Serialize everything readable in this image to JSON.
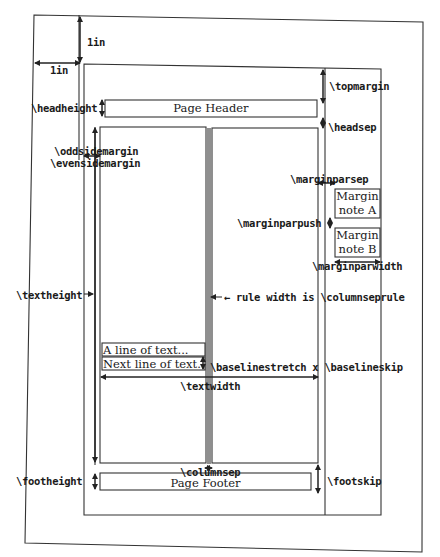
{
  "diagram": {
    "offsets": {
      "vertical": "1in",
      "horizontal": "1in"
    },
    "header": {
      "box_label": "Page Header",
      "headheight": "\\headheight",
      "headsep": "\\headsep",
      "topmargin": "\\topmargin"
    },
    "side_margins": {
      "odd": "\\oddsidemargin",
      "even": "\\evensidemargin"
    },
    "margin_notes": {
      "marginparsep": "\\marginparsep",
      "marginparpush": "\\marginparpush",
      "marginparwidth": "\\marginparwidth",
      "note_a_line1": "Margin",
      "note_a_line2": "note A",
      "note_b_line1": "Margin",
      "note_b_line2": "note B"
    },
    "body": {
      "textheight": "\\textheight",
      "arrow": "→",
      "columnseprule": "← rule width is \\columnseprule",
      "line1": "A line of text...",
      "line2": "Next line of text..",
      "baselineskip": "\\baselinestretch x \\baselineskip",
      "textwidth": "\\textwidth",
      "columnsep": "\\columnsep"
    },
    "footer": {
      "box_label": "Page Footer",
      "footheight": "\\footheight",
      "footskip": "\\footskip"
    }
  }
}
